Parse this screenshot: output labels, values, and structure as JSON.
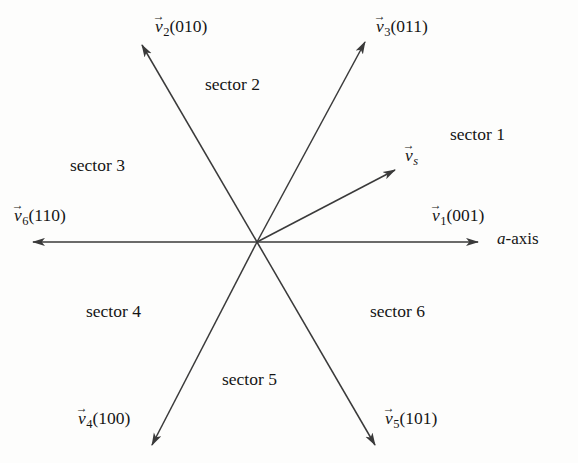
{
  "figure": {
    "type": "space-vector-hexagon-diagram",
    "background_color": "#fdfdfc",
    "line_color": "#3a3a3a",
    "text_color": "#151515",
    "origin": {
      "x": 257,
      "y": 242
    }
  },
  "axis": {
    "label_a": "a",
    "label_suffix": "-axis"
  },
  "reference_vector": {
    "name": "v",
    "accent": "→",
    "subscript": "s",
    "tip": {
      "x": 395,
      "y": 170
    },
    "label_x": 405,
    "label_y": 146
  },
  "vectors": [
    {
      "id": "v1",
      "name": "v",
      "accent": "→",
      "subscript": "1",
      "switching_state": "(001)",
      "angle_deg": 0,
      "tip": {
        "x": 478,
        "y": 242
      },
      "label_x": 432,
      "label_y": 206
    },
    {
      "id": "v2",
      "name": "v",
      "accent": "→",
      "subscript": "2",
      "switching_state": "(010)",
      "angle_deg": 120,
      "tip": {
        "x": 142,
        "y": 45
      },
      "label_x": 155,
      "label_y": 17
    },
    {
      "id": "v3",
      "name": "v",
      "accent": "→",
      "subscript": "3",
      "switching_state": "(011)",
      "angle_deg": 60,
      "tip": {
        "x": 365,
        "y": 42
      },
      "label_x": 376,
      "label_y": 17
    },
    {
      "id": "v4",
      "name": "v",
      "accent": "→",
      "subscript": "4",
      "switching_state": "(100)",
      "angle_deg": 240,
      "tip": {
        "x": 152,
        "y": 445
      },
      "label_x": 78,
      "label_y": 409
    },
    {
      "id": "v5",
      "name": "v",
      "accent": "→",
      "subscript": "5",
      "switching_state": "(101)",
      "angle_deg": 300,
      "tip": {
        "x": 375,
        "y": 445
      },
      "label_x": 385,
      "label_y": 409
    },
    {
      "id": "v6",
      "name": "v",
      "accent": "→",
      "subscript": "6",
      "switching_state": "(110)",
      "angle_deg": 180,
      "tip": {
        "x": 33,
        "y": 242
      },
      "label_x": 14,
      "label_y": 206
    }
  ],
  "sectors": [
    {
      "id": "sector1",
      "label": "sector 1",
      "x": 450,
      "y": 126
    },
    {
      "id": "sector2",
      "label": "sector 2",
      "x": 205,
      "y": 76
    },
    {
      "id": "sector3",
      "label": "sector 3",
      "x": 70,
      "y": 157
    },
    {
      "id": "sector4",
      "label": "sector 4",
      "x": 86,
      "y": 303
    },
    {
      "id": "sector5",
      "label": "sector 5",
      "x": 222,
      "y": 371
    },
    {
      "id": "sector6",
      "label": "sector 6",
      "x": 370,
      "y": 303
    }
  ]
}
